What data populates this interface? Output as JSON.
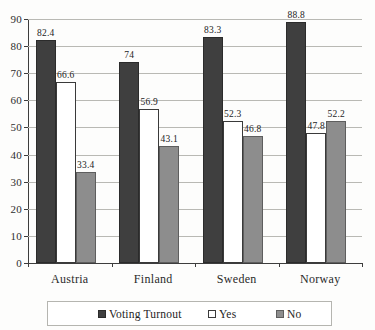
{
  "chart_data": {
    "type": "bar",
    "title": "",
    "xlabel": "",
    "ylabel": "",
    "ylim": [
      0,
      90
    ],
    "ytick_step": 10,
    "yticks": [
      "90",
      "80",
      "70",
      "60",
      "50",
      "40",
      "30",
      "20",
      "10",
      "0"
    ],
    "grid": true,
    "legend_position": "bottom",
    "categories": [
      "Austria",
      "Finland",
      "Sweden",
      "Norway"
    ],
    "series": [
      {
        "name": "Voting Turnout",
        "color": "#3f3f3f",
        "values": [
          82.4,
          74,
          83.3,
          88.8
        ],
        "labels": [
          "82.4",
          "74",
          "83.3",
          "88.8"
        ]
      },
      {
        "name": "Yes",
        "color": "#ffffff",
        "values": [
          66.6,
          56.9,
          52.3,
          47.8
        ],
        "labels": [
          "66.6",
          "56.9",
          "52.3",
          "47.8"
        ]
      },
      {
        "name": "No",
        "color": "#8d8d8d",
        "values": [
          33.4,
          43.1,
          46.8,
          52.2
        ],
        "labels": [
          "33.4",
          "43.1",
          "46.8",
          "52.2"
        ]
      }
    ]
  },
  "legend": {
    "items": [
      {
        "label": "Voting Turnout",
        "swatch": "turnout"
      },
      {
        "label": "Yes",
        "swatch": "yes"
      },
      {
        "label": "No",
        "swatch": "no"
      }
    ]
  }
}
